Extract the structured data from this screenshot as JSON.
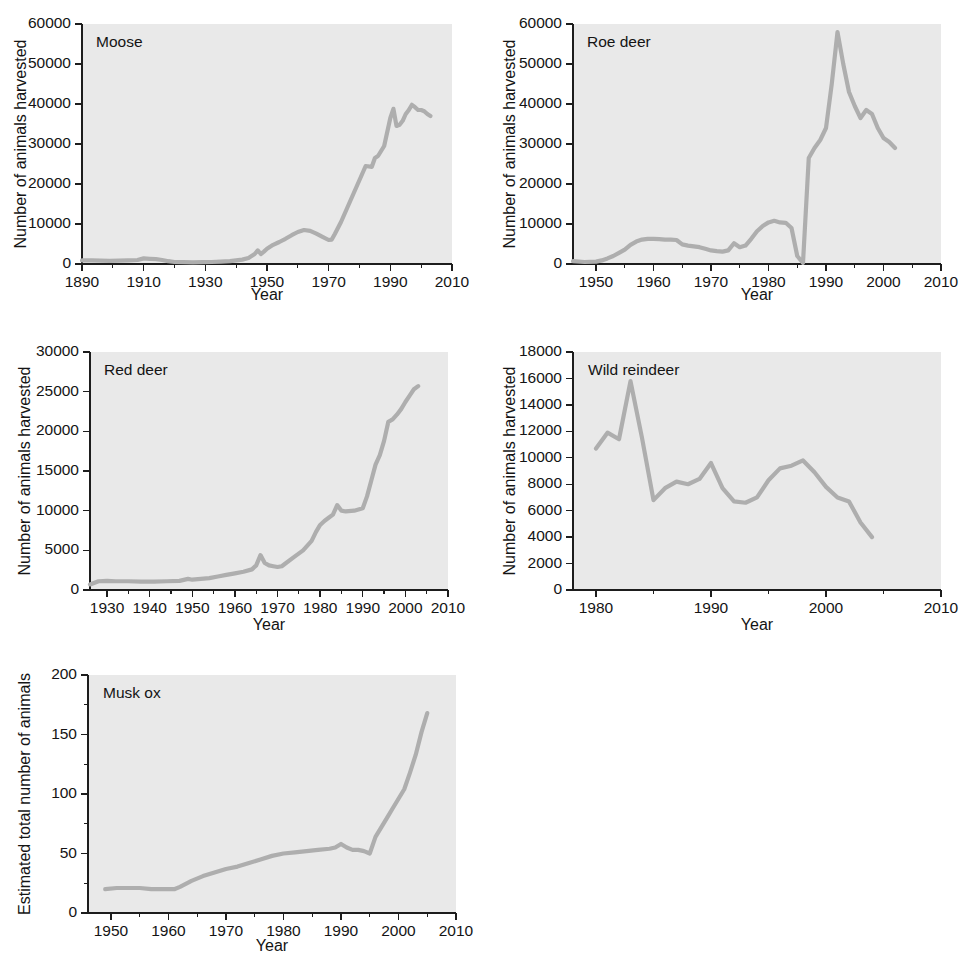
{
  "figure": {
    "background_color": "#ffffff",
    "plot_background_color": "#e9e9e9",
    "line_color": "#aeaeae",
    "axis_color": "#1d1d1d",
    "common_xlabel": "Year"
  },
  "chart_data": [
    {
      "id": "moose",
      "type": "line",
      "title": "Moose",
      "panel_label": "Moose",
      "xlabel": "Year",
      "ylabel": "Number of animals harvested",
      "xlim": [
        1890,
        2010
      ],
      "ylim": [
        0,
        60000
      ],
      "xticks": [
        1890,
        1910,
        1930,
        1950,
        1970,
        1990,
        2010
      ],
      "xtick_labels": [
        "1890",
        "1910",
        "1930",
        "1950",
        "1970",
        "1990",
        "2010"
      ],
      "xminor_step": 10,
      "yticks": [
        0,
        10000,
        20000,
        30000,
        40000,
        50000,
        60000
      ],
      "ytick_labels": [
        "0",
        "10000",
        "20000",
        "30000",
        "40000",
        "50000",
        "60000"
      ],
      "grid": false,
      "legend": "none",
      "x": [
        1890,
        1893,
        1896,
        1899,
        1902,
        1905,
        1908,
        1910,
        1912,
        1914,
        1916,
        1918,
        1920,
        1923,
        1926,
        1929,
        1932,
        1935,
        1938,
        1940,
        1942,
        1944,
        1946,
        1947,
        1948,
        1949,
        1950,
        1951,
        1952,
        1954,
        1956,
        1958,
        1960,
        1962,
        1964,
        1966,
        1968,
        1970,
        1971,
        1972,
        1974,
        1976,
        1978,
        1980,
        1982,
        1984,
        1985,
        1986,
        1988,
        1990,
        1991,
        1992,
        1993,
        1994,
        1995,
        1996,
        1997,
        1998,
        1999,
        2000,
        2001,
        2002,
        2003
      ],
      "y": [
        900,
        900,
        850,
        800,
        850,
        900,
        1000,
        1400,
        1300,
        1200,
        1000,
        700,
        500,
        450,
        400,
        450,
        500,
        600,
        700,
        900,
        1100,
        1500,
        2500,
        3400,
        2500,
        3100,
        3800,
        4300,
        4800,
        5500,
        6300,
        7200,
        8000,
        8500,
        8300,
        7600,
        6800,
        6000,
        6100,
        7500,
        10500,
        14000,
        17500,
        21000,
        24500,
        24300,
        26500,
        27000,
        29500,
        36500,
        38800,
        34500,
        34800,
        35800,
        37500,
        38500,
        39800,
        39200,
        38500,
        38500,
        38200,
        37500,
        37000
      ]
    },
    {
      "id": "roe-deer",
      "type": "line",
      "title": "Roe deer",
      "panel_label": "Roe deer",
      "xlabel": "Year",
      "ylabel": "Number of animals harvested",
      "xlim": [
        1946,
        2010
      ],
      "ylim": [
        0,
        60000
      ],
      "xticks": [
        1950,
        1960,
        1970,
        1980,
        1990,
        2000,
        2010
      ],
      "xtick_labels": [
        "1950",
        "1960",
        "1970",
        "1980",
        "1990",
        "2000",
        "2010"
      ],
      "xminor_step": 5,
      "yticks": [
        0,
        10000,
        20000,
        30000,
        40000,
        50000,
        60000
      ],
      "ytick_labels": [
        "0",
        "10000",
        "20000",
        "30000",
        "40000",
        "50000",
        "60000"
      ],
      "grid": false,
      "legend": "none",
      "x": [
        1946,
        1948,
        1950,
        1951,
        1952,
        1953,
        1954,
        1955,
        1956,
        1957,
        1958,
        1959,
        1960,
        1961,
        1962,
        1963,
        1964,
        1965,
        1966,
        1967,
        1968,
        1969,
        1970,
        1971,
        1972,
        1973,
        1974,
        1975,
        1976,
        1977,
        1978,
        1979,
        1980,
        1981,
        1982,
        1983,
        1984,
        1985,
        1986,
        1987,
        1988,
        1989,
        1990,
        1991,
        1992,
        1993,
        1994,
        1995,
        1996,
        1997,
        1998,
        1999,
        2000,
        2001,
        2002
      ],
      "y": [
        700,
        500,
        600,
        900,
        1400,
        2000,
        2800,
        3600,
        4800,
        5600,
        6100,
        6300,
        6300,
        6200,
        6100,
        6100,
        6000,
        4900,
        4600,
        4400,
        4200,
        3800,
        3400,
        3200,
        3100,
        3400,
        5200,
        4200,
        4600,
        6300,
        8200,
        9500,
        10400,
        10800,
        10400,
        10300,
        9000,
        2000,
        300,
        26500,
        29000,
        31000,
        34000,
        45000,
        58000,
        50000,
        43000,
        39500,
        36500,
        38500,
        37500,
        34000,
        31500,
        30500,
        29000
      ]
    },
    {
      "id": "red-deer",
      "type": "line",
      "title": "Red deer",
      "panel_label": "Red deer",
      "xlabel": "Year",
      "ylabel": "Number of animals harvested",
      "xlim": [
        1926,
        2010
      ],
      "ylim": [
        0,
        30000
      ],
      "xticks": [
        1930,
        1940,
        1950,
        1960,
        1970,
        1980,
        1990,
        2000,
        2010
      ],
      "xtick_labels": [
        "1930",
        "1940",
        "1950",
        "1960",
        "1970",
        "1980",
        "1990",
        "2000",
        "2010"
      ],
      "xminor_step": 5,
      "yticks": [
        0,
        5000,
        10000,
        15000,
        20000,
        25000,
        30000
      ],
      "ytick_labels": [
        "0",
        "5000",
        "10000",
        "15000",
        "20000",
        "25000",
        "30000"
      ],
      "grid": false,
      "legend": "none",
      "x": [
        1926,
        1928,
        1930,
        1932,
        1935,
        1938,
        1941,
        1944,
        1947,
        1949,
        1950,
        1952,
        1954,
        1956,
        1958,
        1960,
        1962,
        1964,
        1965,
        1966,
        1967,
        1968,
        1969,
        1970,
        1971,
        1972,
        1974,
        1976,
        1978,
        1979,
        1980,
        1981,
        1982,
        1983,
        1984,
        1985,
        1986,
        1988,
        1990,
        1991,
        1992,
        1993,
        1994,
        1995,
        1996,
        1997,
        1998,
        1999,
        2000,
        2001,
        2002,
        2003
      ],
      "y": [
        700,
        1100,
        1150,
        1100,
        1100,
        1050,
        1050,
        1100,
        1150,
        1400,
        1300,
        1400,
        1500,
        1700,
        1900,
        2100,
        2300,
        2600,
        3100,
        4400,
        3400,
        3100,
        3000,
        2900,
        3000,
        3400,
        4200,
        5000,
        6200,
        7300,
        8200,
        8700,
        9100,
        9500,
        10700,
        10000,
        9900,
        10000,
        10300,
        11800,
        13800,
        15800,
        17000,
        18800,
        21200,
        21500,
        22100,
        22800,
        23700,
        24500,
        25300,
        25700
      ]
    },
    {
      "id": "wild-reindeer",
      "type": "line",
      "title": "Wild reindeer",
      "panel_label": "Wild reindeer",
      "xlabel": "Year",
      "ylabel": "Number of animals harvested",
      "xlim": [
        1978,
        2010
      ],
      "ylim": [
        0,
        18000
      ],
      "xticks": [
        1980,
        1990,
        2000,
        2010
      ],
      "xtick_labels": [
        "1980",
        "1990",
        "2000",
        "2010"
      ],
      "xminor_step": 5,
      "yticks": [
        0,
        2000,
        4000,
        6000,
        8000,
        10000,
        12000,
        14000,
        16000,
        18000
      ],
      "ytick_labels": [
        "0",
        "2000",
        "4000",
        "6000",
        "8000",
        "10000",
        "12000",
        "14000",
        "16000",
        "18000"
      ],
      "grid": false,
      "legend": "none",
      "x": [
        1980,
        1981,
        1982,
        1983,
        1984,
        1985,
        1986,
        1987,
        1988,
        1989,
        1990,
        1991,
        1992,
        1993,
        1994,
        1995,
        1996,
        1997,
        1998,
        1999,
        2000,
        2001,
        2002,
        2003,
        2004
      ],
      "y": [
        10700,
        11900,
        11400,
        15800,
        11500,
        6800,
        7700,
        8200,
        8000,
        8400,
        9600,
        7700,
        6700,
        6600,
        7000,
        8300,
        9200,
        9400,
        9800,
        8900,
        7800,
        7000,
        6700,
        5100,
        4000
      ]
    },
    {
      "id": "musk-ox",
      "type": "line",
      "title": "Musk ox",
      "panel_label": "Musk ox",
      "xlabel": "Year",
      "ylabel": "Estimated total number of animals",
      "xlim": [
        1946,
        2010
      ],
      "ylim": [
        0,
        200
      ],
      "xticks": [
        1950,
        1960,
        1970,
        1980,
        1990,
        2000,
        2010
      ],
      "xtick_labels": [
        "1950",
        "1960",
        "1970",
        "1980",
        "1990",
        "2000",
        "2010"
      ],
      "xminor_step": 5,
      "yticks": [
        0,
        50,
        100,
        150,
        200
      ],
      "ytick_labels": [
        "0",
        "50",
        "100",
        "150",
        "200"
      ],
      "grid": false,
      "legend": "none",
      "x": [
        1949,
        1951,
        1953,
        1955,
        1957,
        1959,
        1961,
        1962,
        1964,
        1966,
        1968,
        1970,
        1972,
        1974,
        1976,
        1978,
        1980,
        1982,
        1984,
        1986,
        1988,
        1989,
        1990,
        1991,
        1992,
        1993,
        1994,
        1995,
        1996,
        1997,
        1998,
        1999,
        2000,
        2001,
        2002,
        2003,
        2004,
        2005
      ],
      "y": [
        20,
        21,
        21,
        21,
        20,
        20,
        20,
        22,
        27,
        31,
        34,
        37,
        39,
        42,
        45,
        48,
        50,
        51,
        52,
        53,
        54,
        55,
        58,
        55,
        53,
        53,
        52,
        50,
        64,
        72,
        80,
        88,
        96,
        104,
        118,
        133,
        152,
        168
      ]
    }
  ]
}
